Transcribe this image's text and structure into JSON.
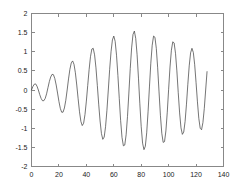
{
  "figure": {
    "background_color": "#ffffff",
    "axes_color": "#888888",
    "line_color": "#3a3a3a"
  },
  "chart_data": {
    "type": "line",
    "title": "",
    "xlabel": "",
    "ylabel": "",
    "xlim": [
      0,
      140
    ],
    "ylim": [
      -2,
      2
    ],
    "grid": false,
    "legend": null,
    "xticks": [
      0,
      20,
      40,
      60,
      80,
      100,
      120,
      140
    ],
    "xtick_labels": [
      "0",
      "20",
      "40",
      "60",
      "80",
      "100",
      "120",
      "140"
    ],
    "yticks": [
      -2,
      -1.5,
      -1,
      -0.5,
      0,
      0.5,
      1,
      1.5,
      2
    ],
    "ytick_labels": [
      "-2",
      "-1.5",
      "-1",
      "-0.5",
      "0",
      "0.5",
      "1",
      "1.5",
      "2"
    ],
    "series": [
      {
        "name": "signal",
        "color": "#3a3a3a",
        "description": "Amplitude-modulated beating waveform, two close frequencies with growing envelope, sampled 0 to 128",
        "x_start": 0,
        "x_end": 128,
        "n_points": 129,
        "values": [
          0.0,
          0.09,
          0.15,
          0.16,
          0.1,
          0.0,
          -0.12,
          -0.22,
          -0.28,
          -0.28,
          -0.22,
          -0.1,
          0.06,
          0.22,
          0.34,
          0.41,
          0.4,
          0.3,
          0.13,
          -0.08,
          -0.3,
          -0.48,
          -0.58,
          -0.58,
          -0.47,
          -0.27,
          0.0,
          0.29,
          0.54,
          0.71,
          0.76,
          0.67,
          0.45,
          0.13,
          -0.23,
          -0.57,
          -0.82,
          -0.93,
          -0.87,
          -0.64,
          -0.29,
          0.12,
          0.53,
          0.87,
          1.07,
          1.09,
          0.92,
          0.58,
          0.12,
          -0.37,
          -0.81,
          -1.14,
          -1.29,
          -1.23,
          -0.96,
          -0.53,
          0.0,
          0.54,
          1.0,
          1.31,
          1.41,
          1.27,
          0.91,
          0.38,
          -0.22,
          -0.8,
          -1.24,
          -1.46,
          -1.44,
          -1.17,
          -0.69,
          -0.08,
          0.56,
          1.1,
          1.45,
          1.54,
          1.35,
          0.92,
          0.31,
          -0.36,
          -0.96,
          -1.39,
          -1.56,
          -1.47,
          -1.12,
          -0.57,
          0.08,
          0.7,
          1.17,
          1.41,
          1.38,
          1.09,
          0.58,
          -0.05,
          -0.66,
          -1.13,
          -1.37,
          -1.35,
          -1.07,
          -0.58,
          0.02,
          0.6,
          1.04,
          1.26,
          1.23,
          0.96,
          0.5,
          -0.07,
          -0.6,
          -0.99,
          -1.16,
          -1.1,
          -0.82,
          -0.37,
          0.15,
          0.63,
          0.97,
          1.09,
          0.98,
          0.66,
          0.19,
          -0.31,
          -0.74,
          -1.0,
          -1.04,
          -0.85,
          -0.48,
          0.0,
          0.48
        ]
      }
    ]
  }
}
